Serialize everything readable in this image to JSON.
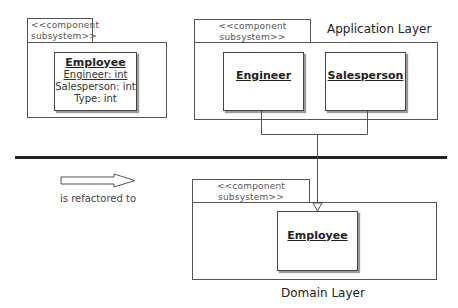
{
  "left_package": {
    "stereotype_line1": "<<component",
    "stereotype_line2": "subsystem>>",
    "class": {
      "name": "Employee",
      "attributes": [
        "Engineer: int",
        "Salesperson: int",
        "Type: int"
      ]
    }
  },
  "application_layer": {
    "label": "Application Layer",
    "stereotype_line1": "<<component",
    "stereotype_line2": "subsystem>>",
    "classes": [
      {
        "name": "Engineer"
      },
      {
        "name": "Salesperson"
      }
    ]
  },
  "transition": {
    "caption": "is refactored to",
    "arrow": "hollow-right-arrow"
  },
  "domain_layer": {
    "label": "Domain Layer",
    "stereotype_line1": "<<component",
    "stereotype_line2": "subsystem>>",
    "classes": [
      {
        "name": "Employee"
      }
    ]
  },
  "relationships": [
    {
      "from": "Engineer",
      "to": "Employee",
      "type": "generalization"
    },
    {
      "from": "Salesperson",
      "to": "Employee",
      "type": "generalization"
    }
  ],
  "colors": {
    "line": "#555555",
    "divider": "#222222",
    "shadow": "#9a9a9a"
  }
}
